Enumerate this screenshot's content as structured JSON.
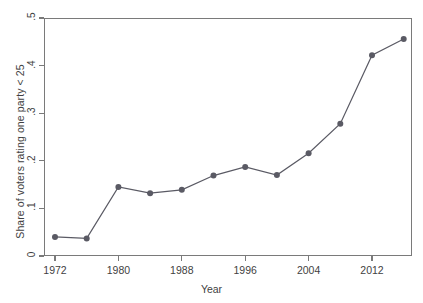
{
  "chart_data": {
    "type": "line",
    "title": "",
    "xlabel": "Year",
    "ylabel": "Share of voters rating one party < 25",
    "xlim": [
      1970,
      1918
    ],
    "x": [
      1972,
      1976,
      1980,
      1984,
      1988,
      1992,
      1996,
      2000,
      2004,
      2008,
      2012,
      2016
    ],
    "values": [
      0.04,
      0.037,
      0.145,
      0.132,
      0.139,
      0.169,
      0.187,
      0.17,
      0.216,
      0.278,
      0.422,
      0.456
    ],
    "xticks": [
      "1972",
      "1980",
      "1988",
      "1996",
      "2004",
      "2012"
    ],
    "xtick_values": [
      1972,
      1980,
      1988,
      1996,
      2004,
      2012
    ],
    "yticks": [
      "0",
      ".1",
      ".2",
      ".3",
      ".4",
      ".5"
    ],
    "ytick_values": [
      0,
      0.1,
      0.2,
      0.3,
      0.4,
      0.5
    ],
    "ylim": [
      0,
      0.5
    ],
    "grid": false,
    "legend": null,
    "series_color": "#5a5a64",
    "axis_color": "#7a7a7a",
    "marker": "circle",
    "marker_size": 6
  },
  "axes": {
    "x_axis_title": "Year",
    "y_axis_title": "Share of voters rating one party < 25"
  }
}
